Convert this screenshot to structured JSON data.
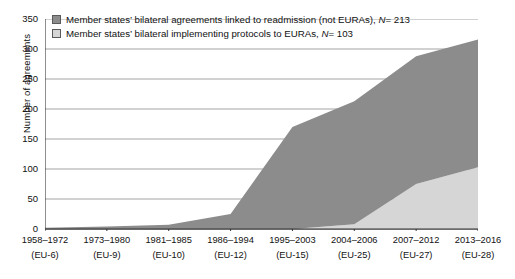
{
  "chart_data": {
    "type": "area",
    "stacked": true,
    "title": "",
    "xlabel": "",
    "ylabel": "Number of agreements",
    "ylim": [
      0,
      350
    ],
    "ytick_step": 50,
    "yticks": [
      "350",
      "300",
      "250",
      "200",
      "150",
      "100",
      "50",
      "0"
    ],
    "grid": true,
    "legend_position": "top-left",
    "categories": [
      "1958–1972",
      "1973–1980",
      "1981–1985",
      "1986–1994",
      "1995–2003",
      "2004–2006",
      "2007–2012",
      "2013–2016"
    ],
    "category_sublabels": [
      "(EU-6)",
      "(EU-9)",
      "(EU-10)",
      "(EU-12)",
      "(EU-15)",
      "(EU-25)",
      "(EU-27)",
      "(EU-28)"
    ],
    "series": [
      {
        "name": "Member states' bilateral agreements linked to readmission (not EURAs)",
        "n_label": "N= 213",
        "n_value": 213,
        "color": "#8c8c8c",
        "values": [
          2,
          4,
          7,
          25,
          170,
          205,
          213,
          213
        ]
      },
      {
        "name": "Member states' bilateral implementing protocols to EURAs",
        "n_label": "N= 103",
        "n_value": 103,
        "color": "#d6d6d6",
        "values": [
          0,
          0,
          0,
          0,
          0,
          8,
          75,
          103
        ]
      }
    ],
    "cumulative_totals": [
      2,
      4,
      7,
      25,
      170,
      213,
      288,
      316
    ]
  },
  "legend": {
    "items": [
      {
        "swatch": "dark",
        "text": "Member states’ bilateral agreements linked to readmission (not EURAs), ",
        "n_label": "N",
        "n_value": "= 213"
      },
      {
        "swatch": "light",
        "text": "Member states’ bilateral implementing protocols to EURAs, ",
        "n_label": "N",
        "n_value": "= 103"
      }
    ]
  },
  "axes": {
    "y_title": "Number of agreements"
  }
}
